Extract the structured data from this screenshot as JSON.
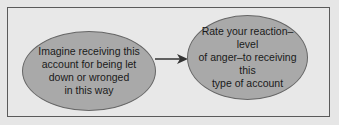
{
  "diagram": {
    "type": "flow",
    "nodes": [
      {
        "id": "step1",
        "label": "Imagine receiving this\naccount for being let\ndown or wronged\nin this way",
        "shape": "ellipse",
        "fill": "#a9a9a9"
      },
      {
        "id": "step2",
        "label": "Rate your reaction–level\nof anger–to receiving this\ntype of account",
        "shape": "ellipse",
        "fill": "#a9a9a9"
      }
    ],
    "edges": [
      {
        "from": "step1",
        "to": "step2",
        "style": "arrow"
      }
    ],
    "colors": {
      "background": "#e6e6e6",
      "frame": "#5a5a5a",
      "node_fill": "#a9a9a9",
      "arrow": "#333333"
    }
  }
}
